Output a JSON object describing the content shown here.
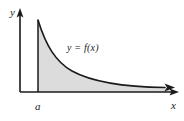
{
  "figure": {
    "name": "improper-integral-area-diagram",
    "background_color": "#ffffff",
    "axis_color": "#1a1a1a",
    "curve_color": "#1a1a1a",
    "shade_color": "#dcdcdc"
  },
  "labels": {
    "y_axis": "y",
    "x_axis": "x",
    "lower_limit": "a",
    "curve": "y = f(x)"
  },
  "geometry": {
    "y_axis_x": 20,
    "x_axis_y": 92,
    "a_x": 38,
    "curve_start_y": 20,
    "curve_end_x": 170,
    "curve_end_y": 87
  }
}
